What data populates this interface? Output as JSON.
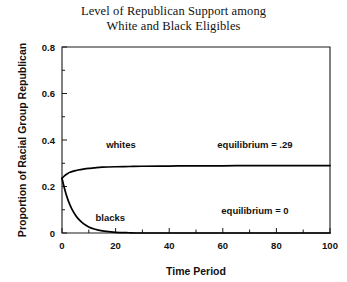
{
  "chart_data": {
    "type": "line",
    "title": "Level of Republican Support among White and Black Eligibles",
    "title_lines": [
      "Level of Republican Support among",
      "White and Black Eligibles"
    ],
    "xlabel": "Time Period",
    "ylabel": "Proportion of Racial Group Republican",
    "xlim": [
      0,
      100
    ],
    "ylim": [
      0,
      0.8
    ],
    "grid": false,
    "legend": "inline-labels",
    "xticks": [
      0,
      20,
      40,
      60,
      80,
      100
    ],
    "xtick_labels": [
      "0",
      "20",
      "40",
      "60",
      "80",
      "100"
    ],
    "xminor_ticks": [
      10,
      30,
      50,
      70,
      90
    ],
    "yticks": [
      0,
      0.2,
      0.4,
      0.6,
      0.8
    ],
    "ytick_labels": [
      "0",
      "0.2",
      "0.4",
      "0.6",
      "0.8"
    ],
    "yminor_ticks": [
      0.1,
      0.3,
      0.5,
      0.7
    ],
    "x": [
      0,
      1,
      2,
      3,
      4,
      5,
      6,
      8,
      10,
      12,
      15,
      20,
      25,
      30,
      40,
      50,
      60,
      70,
      80,
      90,
      100
    ],
    "series": [
      {
        "name": "whites",
        "label": "whites",
        "color": "#000000",
        "equilibrium": 0.29,
        "equilibrium_label": "equilibrium = .29",
        "values": [
          0.235,
          0.247,
          0.255,
          0.261,
          0.265,
          0.268,
          0.271,
          0.275,
          0.278,
          0.28,
          0.283,
          0.285,
          0.286,
          0.287,
          0.288,
          0.289,
          0.289,
          0.29,
          0.29,
          0.29,
          0.29
        ]
      },
      {
        "name": "blacks",
        "label": "blacks",
        "color": "#000000",
        "equilibrium": 0,
        "equilibrium_label": "equilibrium = 0",
        "values": [
          0.235,
          0.188,
          0.15,
          0.12,
          0.096,
          0.077,
          0.062,
          0.04,
          0.026,
          0.017,
          0.009,
          0.003,
          0.001,
          0.0,
          0.0,
          0.0,
          0.0,
          0.0,
          0.0,
          0.0,
          0.0
        ]
      }
    ],
    "annotations": [
      {
        "name": "whites-series-label",
        "text": "whites",
        "x": 22,
        "y": 0.365
      },
      {
        "name": "blacks-series-label",
        "text": "blacks",
        "x": 18,
        "y": 0.052
      },
      {
        "name": "whites-equilibrium-note",
        "text": "equilibrium = .29",
        "x": 72,
        "y": 0.365
      },
      {
        "name": "blacks-equilibrium-note",
        "text": "equilibrium = 0",
        "x": 72,
        "y": 0.082
      }
    ]
  }
}
